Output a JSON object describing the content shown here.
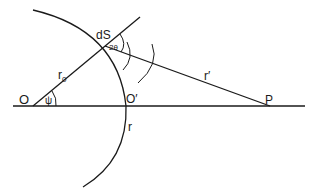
{
  "diagram": {
    "labels": {
      "origin": "O",
      "origin_prime": "O′",
      "point_p": "P",
      "surface_element": "dS",
      "angle_double": "2θ",
      "angle_psi": "ψ",
      "radius_r0_base": "r",
      "radius_r0_sub": "0",
      "radius_r": "r",
      "radius_r_prime": "r′"
    },
    "colors": {
      "stroke": "#1a1a1a",
      "background": "#ffffff"
    }
  }
}
